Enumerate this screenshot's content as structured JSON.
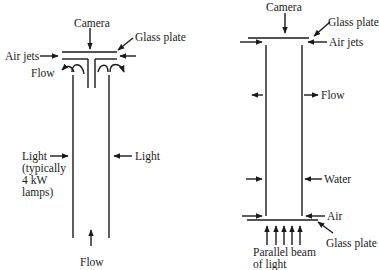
{
  "left_diagram": {
    "camera": "Camera",
    "glass_plate": "Glass plate",
    "air_jets": "Air jets",
    "flow_top": "Flow",
    "light_left": "Light",
    "light_left_note_1": "(typically",
    "light_left_note_2": "4 kW",
    "light_left_note_3": "lamps)",
    "light_right": "Light",
    "flow_bottom": "Flow"
  },
  "right_diagram": {
    "camera": "Camera",
    "glass_plate_top": "Glass plate",
    "air_jets": "Air jets",
    "flow": "Flow",
    "water": "Water",
    "air": "Air",
    "glass_plate_bottom": "Glass plate",
    "beam_1": "Parallel beam",
    "beam_2": "of light"
  },
  "colors": {
    "ink": "#1a1a1a",
    "background": "#ffffff"
  }
}
